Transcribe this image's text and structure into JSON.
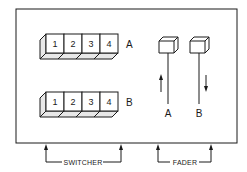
{
  "diagram": {
    "switcher": {
      "caption": "SWITCHER",
      "rows": [
        {
          "label": "A",
          "buttons": [
            "1",
            "2",
            "3",
            "4"
          ]
        },
        {
          "label": "B",
          "buttons": [
            "1",
            "2",
            "3",
            "4"
          ]
        }
      ]
    },
    "fader": {
      "caption": "FADER",
      "levers": [
        {
          "label": "A",
          "direction": "up"
        },
        {
          "label": "B",
          "direction": "down"
        }
      ]
    },
    "colors": {
      "ink": "#1a1a1a",
      "background": "#ffffff"
    }
  }
}
